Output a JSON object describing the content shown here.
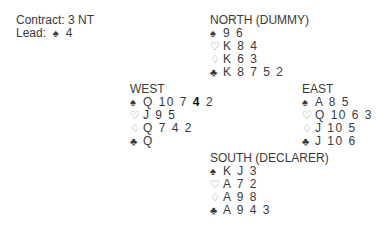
{
  "info": {
    "contract_label": "Contract:",
    "contract_value": "3 NT",
    "lead_label": "Lead:",
    "lead_suit": "♠",
    "lead_card": "4"
  },
  "hands": {
    "north": {
      "title": "NORTH (DUMMY)",
      "spades": "9 6",
      "hearts": "K 8 4",
      "diamonds": "K 6 3",
      "clubs": "K 8 7 5 2"
    },
    "west": {
      "title": "WEST",
      "spades_before": "Q 10 7 ",
      "spades_lead": "4",
      "spades_after": " 2",
      "hearts": "J 9 5",
      "diamonds": "Q 7 4 2",
      "clubs": "Q"
    },
    "east": {
      "title": "EAST",
      "spades": "A 8 5",
      "hearts": "Q 10 6 3",
      "diamonds": "J 10 5",
      "clubs": "J 10 6"
    },
    "south": {
      "title": "SOUTH (DECLARER)",
      "spades": "K J 3",
      "hearts": "A 7 2",
      "diamonds": "A 9 8",
      "clubs": "A 9 4 3"
    }
  },
  "suits": {
    "spade": "♠",
    "heart": "♡",
    "diamond": "♢",
    "club": "♣"
  }
}
